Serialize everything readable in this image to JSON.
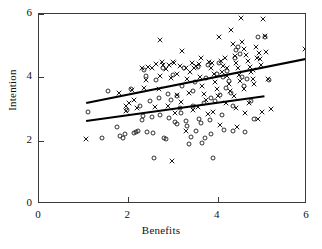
{
  "chart_data": {
    "type": "scatter",
    "title": "",
    "xlabel": "Benefits",
    "ylabel": "Intention",
    "xlim": [
      0,
      6
    ],
    "ylim": [
      0,
      6
    ],
    "xticks": [
      0,
      2,
      4,
      6
    ],
    "yticks": [
      0,
      2,
      4,
      6
    ],
    "xticklabels": [
      "0",
      "2",
      "4",
      "6"
    ],
    "yticklabels": [
      "0",
      "2",
      "4",
      "6"
    ],
    "grid": false,
    "legend": "none",
    "marker_color": "#1a1a1a",
    "line_color": "#000000",
    "frame_color": "#3a3a3a",
    "series": [
      {
        "name": "cross-group",
        "marker": "x",
        "points": [
          [
            1.05,
            2.05
          ],
          [
            1.78,
            3.52
          ],
          [
            1.95,
            3.1
          ],
          [
            2.02,
            3.18
          ],
          [
            2.12,
            3.3
          ],
          [
            2.3,
            4.28
          ],
          [
            2.45,
            4.32
          ],
          [
            2.52,
            4.3
          ],
          [
            2.4,
            3.92
          ],
          [
            2.35,
            3.66
          ],
          [
            2.62,
            4.42
          ],
          [
            2.7,
            5.18
          ],
          [
            2.72,
            4.05
          ],
          [
            2.78,
            4.38
          ],
          [
            2.85,
            4.25
          ],
          [
            2.9,
            4.4
          ],
          [
            2.95,
            3.98
          ],
          [
            2.68,
            3.62
          ],
          [
            2.6,
            3.05
          ],
          [
            2.88,
            3.08
          ],
          [
            3.02,
            4.45
          ],
          [
            3.08,
            4.12
          ],
          [
            3.15,
            4.35
          ],
          [
            3.2,
            4.82
          ],
          [
            3.28,
            4.3
          ],
          [
            3.32,
            3.94
          ],
          [
            3.1,
            3.44
          ],
          [
            3.18,
            3.22
          ],
          [
            3.05,
            2.88
          ],
          [
            3.35,
            3.52
          ],
          [
            3.42,
            4.46
          ],
          [
            3.48,
            4.28
          ],
          [
            3.52,
            4.36
          ],
          [
            3.58,
            4.42
          ],
          [
            3.6,
            4.0
          ],
          [
            3.65,
            3.72
          ],
          [
            3.7,
            3.46
          ],
          [
            3.74,
            3.3
          ],
          [
            3.44,
            2.98
          ],
          [
            3.55,
            3.06
          ],
          [
            3.8,
            4.5
          ],
          [
            3.85,
            4.3
          ],
          [
            3.88,
            4.44
          ],
          [
            3.92,
            4.1
          ],
          [
            3.95,
            3.86
          ],
          [
            3.98,
            3.62
          ],
          [
            4.0,
            3.4
          ],
          [
            4.02,
            5.28
          ],
          [
            3.9,
            2.92
          ],
          [
            3.78,
            2.84
          ],
          [
            4.08,
            4.52
          ],
          [
            4.12,
            4.36
          ],
          [
            4.16,
            4.6
          ],
          [
            4.2,
            4.28
          ],
          [
            4.22,
            4.04
          ],
          [
            4.25,
            3.8
          ],
          [
            4.28,
            3.58
          ],
          [
            4.3,
            5.48
          ],
          [
            4.34,
            5.04
          ],
          [
            4.18,
            3.18
          ],
          [
            4.38,
            4.66
          ],
          [
            4.42,
            4.46
          ],
          [
            4.45,
            4.3
          ],
          [
            4.48,
            4.08
          ],
          [
            4.5,
            3.88
          ],
          [
            4.52,
            5.86
          ],
          [
            4.55,
            5.12
          ],
          [
            4.58,
            4.9
          ],
          [
            4.6,
            3.64
          ],
          [
            4.4,
            3.02
          ],
          [
            4.64,
            4.7
          ],
          [
            4.68,
            4.52
          ],
          [
            4.72,
            4.34
          ],
          [
            4.75,
            4.16
          ],
          [
            4.78,
            3.96
          ],
          [
            4.82,
            3.78
          ],
          [
            4.85,
            4.96
          ],
          [
            4.88,
            4.6
          ],
          [
            4.7,
            3.2
          ],
          [
            4.62,
            2.86
          ],
          [
            4.92,
            4.76
          ],
          [
            4.95,
            4.58
          ],
          [
            4.98,
            4.4
          ],
          [
            5.02,
            5.84
          ],
          [
            5.05,
            5.3
          ],
          [
            5.08,
            4.8
          ],
          [
            5.12,
            3.96
          ],
          [
            5.2,
            3.0
          ],
          [
            4.9,
            2.7
          ],
          [
            5.0,
            2.92
          ],
          [
            5.96,
            4.88
          ],
          [
            4.44,
            2.44
          ],
          [
            4.05,
            2.48
          ],
          [
            3.3,
            2.3
          ],
          [
            2.98,
            1.36
          ],
          [
            1.95,
            2.95
          ],
          [
            2.2,
            3.02
          ],
          [
            2.08,
            3.6
          ],
          [
            2.75,
            4.48
          ],
          [
            3.0,
            4.5
          ],
          [
            3.38,
            4.18
          ],
          [
            3.62,
            4.62
          ],
          [
            4.1,
            4.18
          ],
          [
            4.36,
            3.42
          ],
          [
            4.8,
            4.22
          ]
        ]
      },
      {
        "name": "circle-group",
        "marker": "o",
        "points": [
          [
            1.1,
            2.9
          ],
          [
            1.42,
            2.08
          ],
          [
            1.55,
            3.58
          ],
          [
            1.75,
            2.42
          ],
          [
            1.82,
            2.16
          ],
          [
            1.88,
            2.1
          ],
          [
            1.92,
            2.22
          ],
          [
            2.05,
            3.62
          ],
          [
            2.12,
            2.24
          ],
          [
            2.18,
            2.28
          ],
          [
            2.22,
            2.3
          ],
          [
            2.25,
            3.08
          ],
          [
            2.3,
            2.66
          ],
          [
            2.35,
            4.22
          ],
          [
            2.4,
            4.04
          ],
          [
            2.48,
            3.26
          ],
          [
            2.52,
            2.74
          ],
          [
            2.58,
            1.46
          ],
          [
            2.62,
            3.92
          ],
          [
            2.68,
            3.34
          ],
          [
            2.72,
            2.82
          ],
          [
            2.78,
            4.28
          ],
          [
            2.8,
            2.1
          ],
          [
            2.85,
            2.06
          ],
          [
            2.9,
            2.72
          ],
          [
            2.95,
            3.28
          ],
          [
            3.0,
            4.06
          ],
          [
            3.05,
            2.58
          ],
          [
            3.1,
            2.52
          ],
          [
            3.15,
            3.04
          ],
          [
            3.2,
            3.74
          ],
          [
            3.25,
            4.3
          ],
          [
            3.28,
            2.62
          ],
          [
            3.32,
            2.46
          ],
          [
            3.35,
            1.88
          ],
          [
            3.4,
            2.12
          ],
          [
            3.45,
            3.1
          ],
          [
            3.5,
            3.86
          ],
          [
            3.55,
            4.34
          ],
          [
            3.58,
            2.7
          ],
          [
            3.62,
            2.56
          ],
          [
            3.66,
            1.94
          ],
          [
            3.7,
            3.18
          ],
          [
            3.74,
            3.98
          ],
          [
            3.78,
            4.4
          ],
          [
            3.82,
            2.66
          ],
          [
            3.86,
            2.2
          ],
          [
            3.9,
            1.46
          ],
          [
            3.94,
            3.24
          ],
          [
            3.98,
            4.12
          ],
          [
            4.02,
            4.46
          ],
          [
            4.06,
            3.44
          ],
          [
            4.1,
            2.82
          ],
          [
            4.14,
            2.34
          ],
          [
            4.18,
            3.66
          ],
          [
            4.22,
            4.2
          ],
          [
            4.26,
            3.9
          ],
          [
            4.3,
            3.52
          ],
          [
            4.34,
            3.08
          ],
          [
            4.38,
            4.62
          ],
          [
            4.42,
            4.86
          ],
          [
            4.46,
            4.96
          ],
          [
            4.5,
            4.74
          ],
          [
            4.54,
            4.02
          ],
          [
            4.58,
            3.74
          ],
          [
            4.66,
            3.94
          ],
          [
            4.74,
            3.24
          ],
          [
            4.82,
            2.7
          ],
          [
            4.9,
            5.26
          ],
          [
            5.06,
            5.28
          ],
          [
            5.14,
            3.92
          ],
          [
            4.62,
            2.28
          ],
          [
            4.34,
            2.3
          ],
          [
            2.42,
            2.28
          ],
          [
            2.55,
            2.24
          ],
          [
            3.08,
            3.4
          ],
          [
            3.44,
            3.56
          ],
          [
            2.88,
            3.46
          ],
          [
            3.52,
            2.32
          ],
          [
            3.72,
            2.08
          ],
          [
            1.98,
            2.96
          ],
          [
            2.32,
            2.78
          ],
          [
            3.18,
            2.88
          ],
          [
            3.84,
            3.36
          ],
          [
            4.12,
            4.02
          ]
        ]
      }
    ],
    "trend_lines": [
      {
        "name": "upper-regression-line",
        "x0": 1.05,
        "y0": 3.22,
        "x1": 6.0,
        "y1": 4.62
      },
      {
        "name": "lower-regression-line",
        "x0": 1.05,
        "y0": 2.66,
        "x1": 5.05,
        "y1": 3.44
      }
    ]
  }
}
